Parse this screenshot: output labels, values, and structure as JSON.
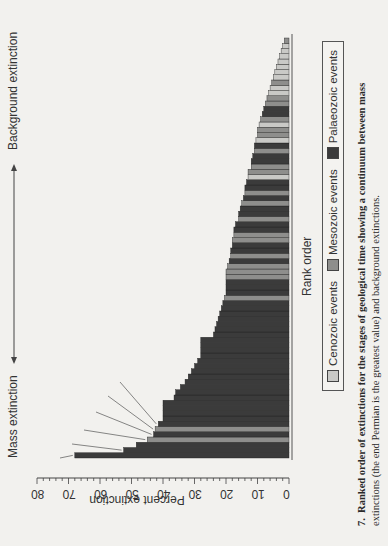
{
  "figure": {
    "caption_number": "7.",
    "caption_line1": "Ranked order of extinctions for the stages of geological time showing a continuum between mass",
    "caption_line2": "extinctions (the end Permian is the greatest value) and background extinctions.",
    "arrow_left_label": "Mass extinction",
    "arrow_right_label": "Background extinction",
    "legend": [
      {
        "label": "Cenozoic events",
        "color": "#c9c9c6"
      },
      {
        "label": "Mesozoic events",
        "color": "#8e8e8c"
      },
      {
        "label": "Palaeozoic events",
        "color": "#3b3b3b"
      }
    ]
  },
  "chart_data": {
    "type": "bar",
    "orientation": "rotated page (figure printed sideways)",
    "title": "",
    "xlabel": "Rank order",
    "ylabel": "Percent extinction",
    "ylim": [
      0,
      80
    ],
    "yticks": [
      0,
      10,
      20,
      30,
      40,
      50,
      60,
      70,
      80
    ],
    "grid": false,
    "legend_position": "below axis label",
    "annotations_mass": [
      "Tatarian (Permo-Triassic)",
      "Ashgillian (Ordovician)",
      "Kazanian (Permo-Triassic)",
      "Norian (Triassic)",
      "Middle Cambrian",
      "Maastrichtian (K-T)"
    ],
    "annotations_background": [
      "Pleistocene",
      "Upper Miocene",
      "Lower Oligocene",
      "Lower Eocene",
      "Upper Oligocene",
      "Hettangian"
    ],
    "values": [
      68,
      52.5,
      48.5,
      45,
      43,
      42.5,
      41.5,
      40,
      40,
      40,
      40,
      36.5,
      36,
      34.5,
      33,
      32,
      31,
      30,
      29,
      28,
      28,
      28,
      28,
      24,
      23.5,
      23,
      22.5,
      22,
      21.5,
      21,
      20.5,
      20,
      20,
      20,
      20,
      20,
      19.5,
      19,
      18.5,
      18.5,
      18,
      18,
      17.5,
      17.5,
      17,
      16,
      16,
      15.5,
      15,
      14.5,
      14,
      14,
      13.5,
      13,
      13,
      12,
      12,
      11.5,
      11,
      11,
      10.5,
      10,
      10,
      9.5,
      9,
      8.5,
      8,
      7.5,
      7,
      6.5,
      6,
      5.5,
      5,
      4.5,
      4,
      3.5,
      3,
      2.5,
      2,
      1.5
    ],
    "eras": [
      "P",
      "P",
      "P",
      "M",
      "P",
      "M",
      "P",
      "P",
      "P",
      "P",
      "P",
      "P",
      "P",
      "P",
      "P",
      "P",
      "P",
      "P",
      "P",
      "P",
      "P",
      "P",
      "P",
      "P",
      "P",
      "P",
      "P",
      "P",
      "P",
      "P",
      "M",
      "P",
      "P",
      "P",
      "M",
      "M",
      "M",
      "P",
      "M",
      "P",
      "P",
      "M",
      "M",
      "P",
      "P",
      "M",
      "P",
      "P",
      "M",
      "P",
      "M",
      "P",
      "P",
      "C",
      "M",
      "M",
      "P",
      "P",
      "M",
      "P",
      "C",
      "M",
      "M",
      "C",
      "M",
      "P",
      "P",
      "M",
      "M",
      "C",
      "C",
      "M",
      "C",
      "C",
      "C",
      "C",
      "C",
      "C",
      "C",
      "M"
    ]
  },
  "axis": {
    "ticks": [
      "0",
      "10",
      "20",
      "30",
      "40",
      "50",
      "60",
      "70",
      "80"
    ]
  }
}
